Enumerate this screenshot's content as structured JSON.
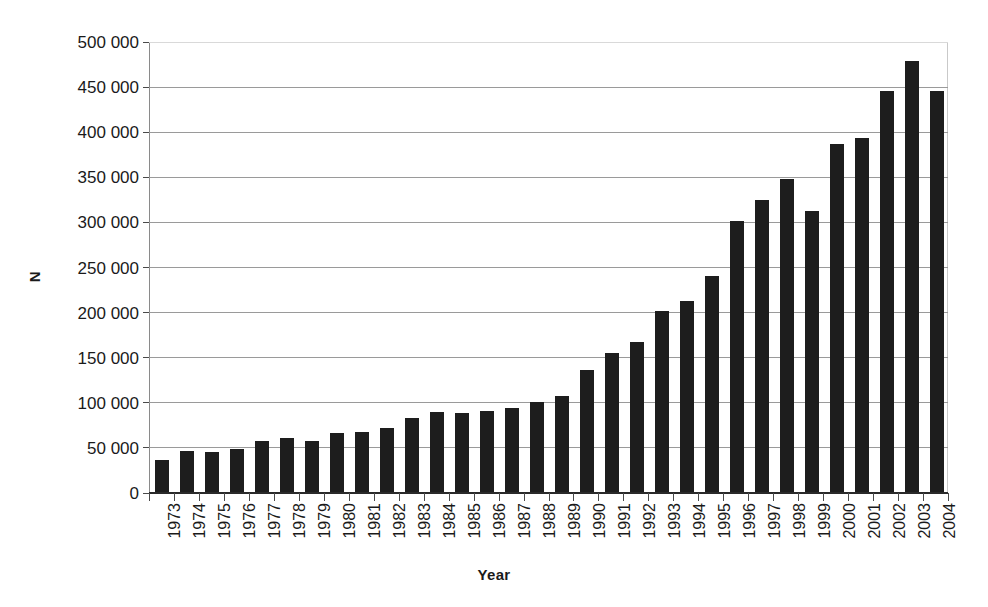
{
  "chart_data": {
    "type": "bar",
    "title": "",
    "subtitle": "",
    "xlabel": "Year",
    "ylabel": "N",
    "categories": [
      "1973",
      "1974",
      "1975",
      "1976",
      "1977",
      "1978",
      "1979",
      "1980",
      "1981",
      "1982",
      "1983",
      "1984",
      "1985",
      "1986",
      "1987",
      "1988",
      "1989",
      "1990",
      "1991",
      "1992",
      "1993",
      "1994",
      "1995",
      "1996",
      "1997",
      "1998",
      "1999",
      "2000",
      "2001",
      "2002",
      "2003",
      "2004"
    ],
    "values": [
      35000,
      45000,
      44000,
      48000,
      57000,
      60000,
      57000,
      65000,
      67000,
      71000,
      82000,
      89000,
      88000,
      90000,
      93000,
      100000,
      106000,
      135000,
      154000,
      166000,
      201000,
      212000,
      239000,
      300000,
      324000,
      347000,
      311000,
      386000,
      392000,
      445000,
      478000,
      445000
    ],
    "ylim": [
      0,
      500000
    ],
    "ytick_values": [
      0,
      50000,
      100000,
      150000,
      200000,
      250000,
      300000,
      350000,
      400000,
      450000,
      500000
    ],
    "ytick_labels": [
      "0",
      "50 000",
      "100 000",
      "150 000",
      "200 000",
      "250 000",
      "300 000",
      "350 000",
      "400 000",
      "450 000",
      "500 000"
    ],
    "grid": true,
    "grid_axis": "y",
    "legend": false,
    "legend_position": "none",
    "bar_color": "#1d1d1d",
    "background_color": "#ffffff",
    "gridline_color": "#9a9a9a",
    "axis_color": "#2a2a2a"
  }
}
